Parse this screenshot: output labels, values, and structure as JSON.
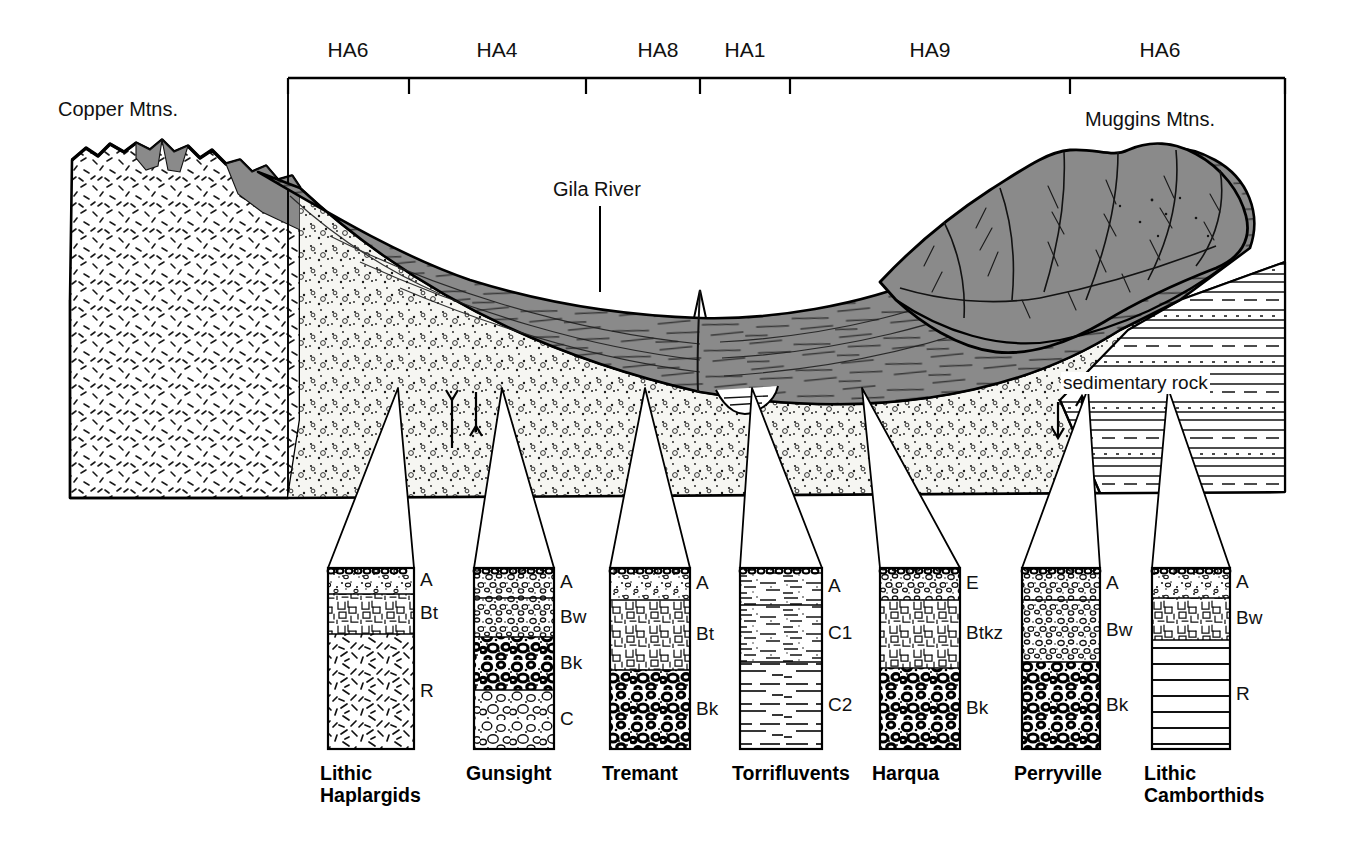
{
  "figure": {
    "type": "soil-catena-block-diagram",
    "title_present": false
  },
  "scale_bar": {
    "name": "map-unit-scale-bar",
    "segments": [
      {
        "label": "HA6",
        "x_center": 348
      },
      {
        "label": "HA4",
        "x_center": 497
      },
      {
        "label": "HA8",
        "x_center": 658
      },
      {
        "label": "HA1",
        "x_center": 745
      },
      {
        "label": "HA9",
        "x_center": 930
      },
      {
        "label": "HA6",
        "x_center": 1160
      }
    ],
    "tick_positions": [
      288,
      409,
      586,
      700,
      790,
      1070,
      1285
    ],
    "left": 288,
    "right": 1285,
    "baseline_y": 78
  },
  "landform_labels": {
    "left_mountain": "Copper Mtns.",
    "right_mountain": "Muggins Mtns.",
    "river": "Gila River",
    "bedrock_right": "sedimentary rock"
  },
  "colors": {
    "piedmont_fill": "#8a8a8a",
    "alluvium_fill": "#f2f2ee",
    "outline": "#000000",
    "page_background": "#ffffff"
  },
  "profiles": [
    {
      "name": "Lithic Haplargids",
      "caption_lines": "Lithic\nHaplargids",
      "x": 328,
      "width": 86,
      "top": 568,
      "bottom": 749,
      "apex_x": 398,
      "apex_y": 388,
      "horizons": [
        {
          "label": "A",
          "top": 568,
          "bottom": 594,
          "texture": "gravelly-loam"
        },
        {
          "label": "Bt",
          "top": 594,
          "bottom": 634,
          "texture": "clay-blocky"
        },
        {
          "label": "R",
          "top": 634,
          "bottom": 749,
          "texture": "fractured-bedrock"
        }
      ]
    },
    {
      "name": "Gunsight",
      "caption_lines": "Gunsight",
      "x": 474,
      "width": 80,
      "top": 568,
      "bottom": 749,
      "apex_x": 502,
      "apex_y": 388,
      "horizons": [
        {
          "label": "A",
          "top": 568,
          "bottom": 598,
          "texture": "gravelly-sand"
        },
        {
          "label": "Bw",
          "top": 598,
          "bottom": 637,
          "texture": "gravel-small"
        },
        {
          "label": "Bk",
          "top": 637,
          "bottom": 690,
          "texture": "carbonate-coated-gravel"
        },
        {
          "label": "C",
          "top": 690,
          "bottom": 749,
          "texture": "gravel-open"
        }
      ]
    },
    {
      "name": "Tremant",
      "caption_lines": "Tremant",
      "x": 610,
      "width": 80,
      "top": 568,
      "bottom": 749,
      "apex_x": 645,
      "apex_y": 388,
      "horizons": [
        {
          "label": "A",
          "top": 568,
          "bottom": 600,
          "texture": "gravelly-loam"
        },
        {
          "label": "Bt",
          "top": 600,
          "bottom": 670,
          "texture": "clay-blocky"
        },
        {
          "label": "Bk",
          "top": 670,
          "bottom": 749,
          "texture": "carbonate-coated-gravel"
        }
      ]
    },
    {
      "name": "Torrifluvents",
      "caption_lines": "Torrifluvents",
      "x": 740,
      "width": 82,
      "top": 568,
      "bottom": 749,
      "apex_x": 752,
      "apex_y": 388,
      "horizons": [
        {
          "label": "A",
          "top": 568,
          "bottom": 605,
          "texture": "stratified-fine"
        },
        {
          "label": "C1",
          "top": 605,
          "bottom": 662,
          "texture": "stratified-fine"
        },
        {
          "label": "C2",
          "top": 662,
          "bottom": 749,
          "texture": "stratified-coarse"
        }
      ]
    },
    {
      "name": "Harqua",
      "caption_lines": "Harqua",
      "x": 880,
      "width": 80,
      "top": 568,
      "bottom": 749,
      "apex_x": 862,
      "apex_y": 388,
      "horizons": [
        {
          "label": "E",
          "top": 568,
          "bottom": 600,
          "texture": "gravelly-sand"
        },
        {
          "label": "Btkz",
          "top": 600,
          "bottom": 668,
          "texture": "clay-blocky"
        },
        {
          "label": "Bk",
          "top": 668,
          "bottom": 749,
          "texture": "carbonate-coated-gravel"
        }
      ]
    },
    {
      "name": "Perryville",
      "caption_lines": "Perryville",
      "x": 1022,
      "width": 78,
      "top": 568,
      "bottom": 749,
      "apex_x": 1088,
      "apex_y": 388,
      "horizons": [
        {
          "label": "A",
          "top": 568,
          "bottom": 600,
          "texture": "gravelly-sand"
        },
        {
          "label": "Bw",
          "top": 600,
          "bottom": 662,
          "texture": "gravel-small"
        },
        {
          "label": "Bk",
          "top": 662,
          "bottom": 749,
          "texture": "carbonate-coated-gravel"
        }
      ]
    },
    {
      "name": "Lithic Camborthids",
      "caption_lines": "Lithic\nCamborthids",
      "x": 1152,
      "width": 78,
      "top": 568,
      "bottom": 749,
      "apex_x": 1168,
      "apex_y": 388,
      "horizons": [
        {
          "label": "A",
          "top": 568,
          "bottom": 598,
          "texture": "gravelly-loam"
        },
        {
          "label": "Bw",
          "top": 598,
          "bottom": 640,
          "texture": "clay-blocky"
        },
        {
          "label": "R",
          "top": 640,
          "bottom": 749,
          "texture": "bedded-sedimentary"
        }
      ]
    }
  ]
}
